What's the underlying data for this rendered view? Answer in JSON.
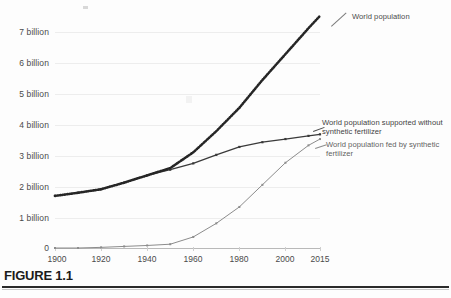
{
  "figure": {
    "label": "FIGURE 1.1",
    "cut_caption": ""
  },
  "annotations": {
    "world_population": "World population",
    "supported_without": "World population supported without synthetic fertilizer",
    "fed_by": "World population fed by synthetic fertilizer"
  },
  "chart_data": {
    "type": "line",
    "title": "",
    "xlabel": "",
    "ylabel": "",
    "xlim": [
      1900,
      2015
    ],
    "ylim": [
      0,
      7.6
    ],
    "grid": true,
    "legend_position": "right-inline-annotations",
    "y_tick_labels": [
      "0",
      "1 billion",
      "2 billion",
      "3 billion",
      "4 billion",
      "5 billion",
      "6 billion",
      "7 billion"
    ],
    "y_tick_values": [
      0,
      1,
      2,
      3,
      4,
      5,
      6,
      7
    ],
    "x_tick_labels": [
      "1900",
      "1920",
      "1940",
      "1960",
      "1980",
      "2000",
      "2015"
    ],
    "x_tick_values": [
      1900,
      1920,
      1940,
      1960,
      1980,
      2000,
      2015
    ],
    "x": [
      1900,
      1910,
      1920,
      1930,
      1940,
      1950,
      1960,
      1970,
      1980,
      1990,
      2000,
      2010,
      2015
    ],
    "series": [
      {
        "name": "World population",
        "color": "#262626",
        "style": "dotted-thick",
        "values": [
          1.65,
          1.75,
          1.86,
          2.07,
          2.3,
          2.53,
          3.03,
          3.7,
          4.44,
          5.32,
          6.14,
          6.96,
          7.35
        ]
      },
      {
        "name": "World population supported without synthetic fertilizer",
        "color": "#3a3a3a",
        "style": "solid-marker",
        "values": [
          1.65,
          1.75,
          1.86,
          2.07,
          2.3,
          2.48,
          2.68,
          2.95,
          3.2,
          3.35,
          3.45,
          3.55,
          3.6
        ]
      },
      {
        "name": "World population fed by synthetic fertilizer",
        "color": "#8c8c8c",
        "style": "solid-marker-light",
        "values": [
          0.0,
          0.0,
          0.02,
          0.05,
          0.08,
          0.12,
          0.35,
          0.78,
          1.3,
          2.0,
          2.7,
          3.25,
          3.45
        ]
      }
    ]
  }
}
